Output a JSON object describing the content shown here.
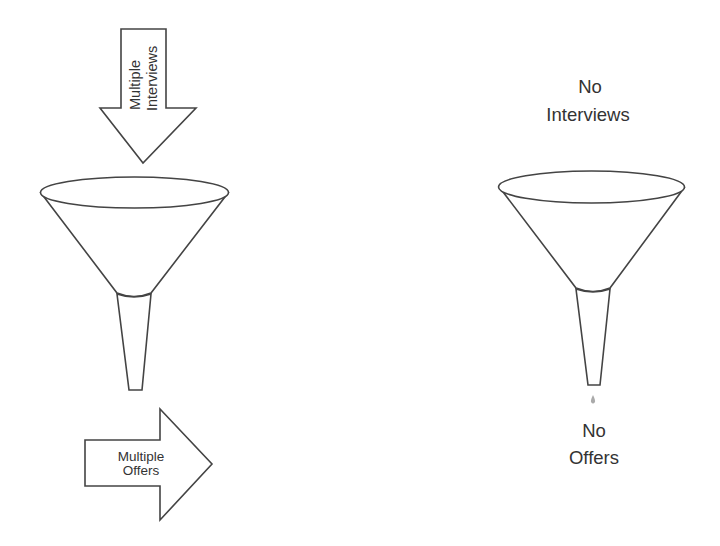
{
  "diagram": {
    "left_scenario": {
      "input_arrow": {
        "direction": "down",
        "label_lines": [
          "Multiple",
          "Interviews"
        ]
      },
      "funnel": {
        "has_output": true
      },
      "output_arrow": {
        "direction": "right",
        "label_lines": [
          "Multiple",
          "Offers"
        ]
      }
    },
    "right_scenario": {
      "input_label_lines": [
        "No",
        "Interviews"
      ],
      "funnel": {
        "has_output": false,
        "drip": true
      },
      "output_label_lines": [
        "No",
        "Offers"
      ]
    },
    "colors": {
      "stroke": "#444444",
      "text": "#333333",
      "fill": "#ffffff",
      "drip": "#aaaaaa"
    }
  }
}
